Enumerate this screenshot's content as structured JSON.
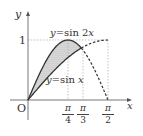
{
  "diagram": {
    "axes": {
      "x_label": "x",
      "y_label": "y",
      "origin_label": "O",
      "y_tick_label": "1"
    },
    "x_ticks": [
      {
        "num": "π",
        "den": "4",
        "value": 0.7854
      },
      {
        "num": "π",
        "den": "3",
        "value": 1.0472
      },
      {
        "num": "π",
        "den": "2",
        "value": 1.5708
      }
    ],
    "curves": [
      {
        "label": "y=sin 2x",
        "eq_lhs": "y",
        "eq_op": "=",
        "eq_rhs": "sin 2x"
      },
      {
        "label": "y=sin x",
        "eq_lhs": "y",
        "eq_op": "=",
        "eq_rhs": "sin x"
      }
    ],
    "shaded_region": "between sin 2x (upper) and sin x (lower) from 0 to π/3",
    "colors": {
      "axis": "#666666",
      "curve": "#333333",
      "guide": "#aaaaaa",
      "shade": "#cccccc"
    }
  }
}
